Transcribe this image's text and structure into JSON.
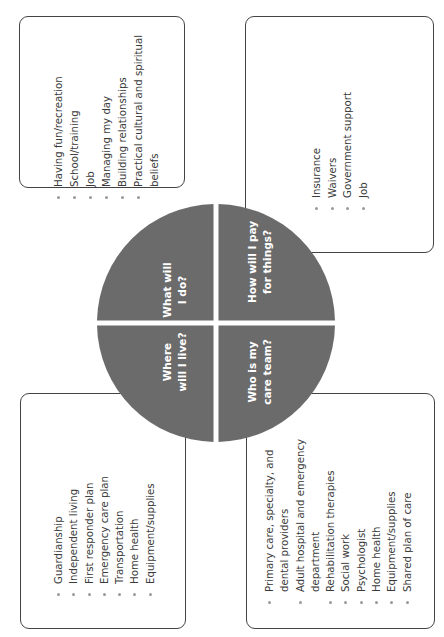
{
  "diagram": {
    "center_color": "#6b6b6b",
    "quadrants": [
      {
        "id": "live",
        "label_lines": [
          "Where",
          "will I live?"
        ],
        "items": [
          {
            "text": "Guardianship"
          },
          {
            "text": "Independent living"
          },
          {
            "text": "First responder plan"
          },
          {
            "text": "Emergency care plan"
          },
          {
            "text": "Transportation"
          },
          {
            "text": "Home health"
          },
          {
            "text": "Equipment/supplies"
          }
        ]
      },
      {
        "id": "do",
        "label_lines": [
          "What will",
          "I do?"
        ],
        "items": [
          {
            "text": "Having fun/recreation"
          },
          {
            "text": "School/training"
          },
          {
            "text": "Job"
          },
          {
            "text": "Managing my day"
          },
          {
            "text": "Building relationships"
          },
          {
            "text": "Practical cultural and spiritual",
            "cont": "beliefs"
          }
        ]
      },
      {
        "id": "care",
        "label_lines": [
          "Who is my",
          "care team?"
        ],
        "items": [
          {
            "text": "Primary care, specialty, and",
            "cont": "dental providers"
          },
          {
            "text": "Adult hospital and emergency",
            "cont": "department"
          },
          {
            "text": "Rehabilitation therapies"
          },
          {
            "text": "Social work"
          },
          {
            "text": "Psychologist"
          },
          {
            "text": "Home health"
          },
          {
            "text": "Equipment/supplies"
          },
          {
            "text": "Shared plan of care"
          }
        ]
      },
      {
        "id": "pay",
        "label_lines": [
          "How will I pay",
          "for things?"
        ],
        "items": [
          {
            "text": "Insurance"
          },
          {
            "text": "Waivers"
          },
          {
            "text": "Government support"
          },
          {
            "text": "Job"
          }
        ]
      }
    ]
  }
}
